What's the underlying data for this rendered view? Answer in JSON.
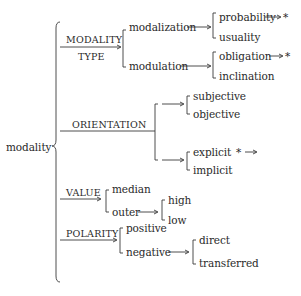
{
  "root": {
    "label": "modality"
  },
  "systems": [
    {
      "label_top": "MODALITY",
      "label_bottom": "TYPE"
    },
    {
      "label": "ORIENTATION"
    },
    {
      "label": "VALUE"
    },
    {
      "label": "POLARITY"
    }
  ],
  "type": {
    "modalization": {
      "label": "modalization",
      "options": [
        "probability",
        "usuality"
      ],
      "probability_marker": "→ *"
    },
    "modulation": {
      "label": "modulation",
      "options": [
        "obligation",
        "inclination"
      ],
      "obligation_marker": "→ *"
    }
  },
  "orientation": {
    "options_a": [
      "subjective",
      "objective"
    ],
    "options_b": [
      "explicit",
      "implicit"
    ],
    "explicit_marker": "* →"
  },
  "value": {
    "median": "median",
    "outer": "outer",
    "outer_options": [
      "high",
      "low"
    ]
  },
  "polarity": {
    "positive": "positive",
    "negative": "negative",
    "negative_options": [
      "direct",
      "transferred"
    ]
  },
  "colors": {
    "ink": "#2a2a2a",
    "background": "#ffffff"
  }
}
